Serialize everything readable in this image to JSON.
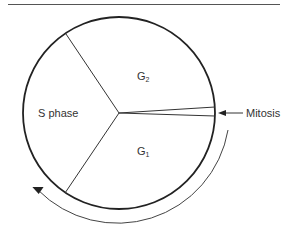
{
  "diagram": {
    "type": "cell-cycle",
    "phases": [
      {
        "id": "s-phase",
        "label": "S phase"
      },
      {
        "id": "g2",
        "label": "G",
        "subscript": "2"
      },
      {
        "id": "g1",
        "label": "G",
        "subscript": "1"
      },
      {
        "id": "mitosis",
        "label": "Mitosis"
      }
    ],
    "direction": "clockwise",
    "colors": {
      "stroke": "#222222",
      "text": "#333333",
      "background": "#ffffff"
    }
  }
}
